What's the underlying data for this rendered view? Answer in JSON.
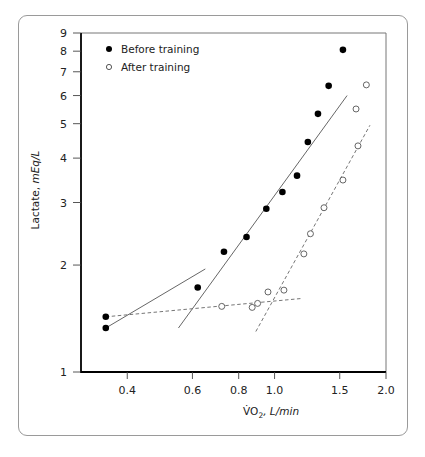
{
  "chart_data": {
    "type": "scatter",
    "title": "",
    "xlabel": "VO2, L/min",
    "xlabel_parts": {
      "main": "V̇O",
      "sub": "2",
      "unit": ", L/min"
    },
    "ylabel": "Lactate, mEq/L",
    "ylabel_parts": {
      "main": "Lactate, ",
      "unit": "mEq/L"
    },
    "xscale": "log",
    "yscale": "log",
    "xlim": [
      0.3,
      2.0
    ],
    "ylim": [
      1,
      9
    ],
    "xticks": [
      0.4,
      0.6,
      0.8,
      1.0,
      1.5,
      2.0
    ],
    "xtick_labels": [
      "0.4",
      "0.6",
      "0.8",
      "1.0",
      "1.5",
      "2.0"
    ],
    "yticks": [
      1,
      2,
      3,
      4,
      5,
      6,
      7,
      8,
      9
    ],
    "ytick_labels": [
      "1",
      "2",
      "3",
      "4",
      "5",
      "6",
      "7",
      "8",
      "9"
    ],
    "grid": false,
    "legend_position": "upper left",
    "series": [
      {
        "name": "Before training",
        "marker": "filled-circle",
        "x": [
          0.35,
          0.35,
          0.62,
          0.73,
          0.84,
          0.95,
          1.05,
          1.15,
          1.23,
          1.31,
          1.4,
          1.53
        ],
        "y": [
          1.33,
          1.43,
          1.73,
          2.18,
          2.4,
          2.88,
          3.21,
          3.57,
          4.44,
          5.33,
          6.39,
          8.07
        ]
      },
      {
        "name": "After training",
        "marker": "open-circle",
        "x": [
          0.72,
          0.87,
          0.9,
          0.96,
          1.06,
          1.2,
          1.25,
          1.36,
          1.53,
          1.68,
          1.66,
          1.77
        ],
        "y": [
          1.53,
          1.52,
          1.56,
          1.68,
          1.7,
          2.15,
          2.45,
          2.9,
          3.47,
          4.33,
          5.5,
          6.43
        ]
      }
    ],
    "fit_lines": [
      {
        "series": "Before training",
        "style": "solid",
        "from": [
          0.35,
          1.33
        ],
        "to": [
          0.65,
          1.95
        ]
      },
      {
        "series": "Before training",
        "style": "solid",
        "from": [
          0.55,
          1.33
        ],
        "to": [
          1.57,
          6.0
        ]
      },
      {
        "series": "After training",
        "style": "dashed",
        "from": [
          0.35,
          1.43
        ],
        "to": [
          1.18,
          1.61
        ]
      },
      {
        "series": "After training",
        "style": "dashed",
        "from": [
          0.89,
          1.3
        ],
        "to": [
          1.81,
          4.95
        ]
      }
    ]
  },
  "legend": {
    "before_label": "Before training",
    "after_label": "After training"
  }
}
